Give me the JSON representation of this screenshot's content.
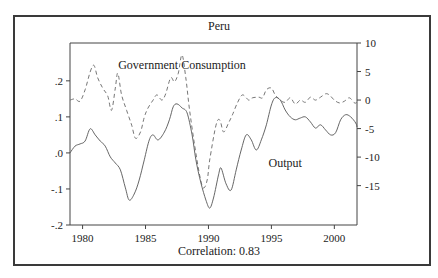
{
  "chart_data": {
    "type": "line",
    "title": "Peru",
    "footer": "Correlation: 0.83",
    "xlabel": "",
    "x_ticks": [
      1980,
      1985,
      1990,
      1995,
      2000
    ],
    "xlim": [
      1979,
      2001.8
    ],
    "left_axis": {
      "ticks": [
        ".2",
        ".1",
        ".0",
        "-.1",
        "-.2"
      ],
      "tick_values": [
        0.2,
        0.1,
        0.0,
        -0.1,
        -0.2
      ],
      "ylim": [
        -0.2,
        0.305
      ]
    },
    "right_axis": {
      "ticks": [
        "10",
        "5",
        "0",
        "-5",
        "-10",
        "-15"
      ],
      "tick_values": [
        10,
        5,
        0,
        -5,
        -10,
        -15
      ],
      "ylim": [
        -21.9,
        10
      ]
    },
    "grid": false,
    "legend": "inline labels",
    "series": [
      {
        "name": "Output",
        "axis": "left",
        "style": "solid",
        "label_pos": {
          "x": 1996.1,
          "y": -0.04
        },
        "x": [
          1979.0,
          1979.4,
          1979.8,
          1980.2,
          1980.6,
          1981.0,
          1981.4,
          1981.8,
          1982.2,
          1982.6,
          1983.0,
          1983.4,
          1983.7,
          1984.1,
          1984.5,
          1984.9,
          1985.3,
          1985.6,
          1986.0,
          1986.5,
          1986.9,
          1987.2,
          1987.5,
          1987.9,
          1988.3,
          1988.7,
          1989.0,
          1989.4,
          1989.8,
          1990.1,
          1990.4,
          1990.8,
          1991.0,
          1991.4,
          1991.8,
          1992.2,
          1992.6,
          1993.0,
          1993.4,
          1993.8,
          1994.2,
          1994.6,
          1995.0,
          1995.3,
          1995.7,
          1996.1,
          1996.5,
          1996.9,
          1997.3,
          1997.7,
          1998.1,
          1998.5,
          1998.9,
          1999.3,
          1999.7,
          2000.1,
          2000.5,
          2000.9,
          2001.3,
          2001.7,
          2001.8
        ],
        "values": [
          0.0,
          0.019,
          0.025,
          0.033,
          0.067,
          0.05,
          0.033,
          0.019,
          -0.011,
          -0.028,
          -0.047,
          -0.097,
          -0.131,
          -0.114,
          -0.075,
          -0.019,
          0.036,
          0.05,
          0.036,
          0.058,
          0.092,
          0.128,
          0.136,
          0.125,
          0.111,
          0.05,
          -0.019,
          -0.083,
          -0.131,
          -0.153,
          -0.125,
          -0.061,
          -0.042,
          -0.086,
          -0.103,
          -0.047,
          0.008,
          0.05,
          0.036,
          0.008,
          0.036,
          0.078,
          0.133,
          0.153,
          0.147,
          0.119,
          0.1,
          0.092,
          0.097,
          0.1,
          0.086,
          0.069,
          0.078,
          0.064,
          0.05,
          0.056,
          0.092,
          0.106,
          0.1,
          0.083,
          0.072
        ]
      },
      {
        "name": "Government Consumption",
        "axis": "right",
        "style": "dashed",
        "label_pos": {
          "x": 1987.9,
          "y": 5.5
        },
        "x": [
          1979.0,
          1979.4,
          1979.8,
          1980.2,
          1980.6,
          1980.9,
          1981.2,
          1981.6,
          1982.0,
          1982.3,
          1982.6,
          1982.8,
          1983.1,
          1983.5,
          1983.9,
          1984.2,
          1984.6,
          1984.9,
          1985.2,
          1985.6,
          1985.9,
          1986.3,
          1986.6,
          1987.0,
          1987.3,
          1987.6,
          1987.9,
          1988.2,
          1988.5,
          1988.9,
          1989.3,
          1989.6,
          1989.9,
          1990.1,
          1990.6,
          1990.9,
          1991.2,
          1991.6,
          1991.9,
          1992.3,
          1992.7,
          1993.2,
          1993.5,
          1994.0,
          1994.3,
          1994.6,
          1995.0,
          1995.3,
          1995.7,
          1996.1,
          1996.5,
          1996.9,
          1997.3,
          1997.7,
          1998.1,
          1998.5,
          1998.9,
          1999.3,
          1999.6,
          2000.0,
          2000.4,
          2000.8,
          2001.2,
          2001.6,
          2001.8
        ],
        "values": [
          0.0,
          0.2,
          -0.2,
          1.8,
          4.9,
          6.1,
          3.9,
          2.1,
          0.7,
          -1.8,
          2.1,
          4.7,
          0.9,
          -1.8,
          -4.4,
          -6.7,
          -5.6,
          -3.0,
          -1.4,
          0.0,
          0.9,
          0.0,
          1.1,
          3.9,
          3.2,
          4.7,
          7.9,
          3.9,
          -1.8,
          -7.9,
          -13.2,
          -15.4,
          -14.0,
          -10.5,
          -4.4,
          -3.5,
          -5.6,
          -4.0,
          -2.6,
          -0.5,
          0.9,
          0.0,
          0.4,
          0.5,
          0.4,
          1.8,
          2.1,
          0.9,
          0.0,
          -0.4,
          0.4,
          -0.7,
          0.0,
          -0.4,
          0.5,
          0.0,
          0.5,
          1.1,
          0.9,
          0.0,
          -0.5,
          -0.2,
          0.4,
          -0.5,
          -0.4
        ]
      }
    ]
  },
  "title": "Peru",
  "footer": "Correlation: 0.83"
}
